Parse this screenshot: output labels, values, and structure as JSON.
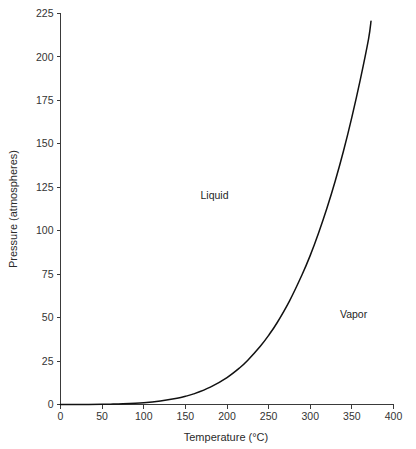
{
  "chart_data": {
    "type": "line",
    "title": "",
    "subtitle": "",
    "xlabel": "Temperature (°C)",
    "ylabel": "Pressure (atmospheres)",
    "xlim": [
      0,
      400
    ],
    "ylim": [
      0,
      225
    ],
    "xticks": [
      0,
      50,
      100,
      150,
      200,
      250,
      300,
      350,
      400
    ],
    "xtick_labels": [
      "0",
      "50",
      "100",
      "150",
      "200",
      "250",
      "300",
      "350",
      "400"
    ],
    "yticks": [
      0,
      25,
      50,
      75,
      100,
      125,
      150,
      175,
      200,
      225
    ],
    "ytick_labels": [
      "0",
      "25",
      "50",
      "75",
      "100",
      "125",
      "150",
      "175",
      "200",
      "225"
    ],
    "grid": false,
    "legend": false,
    "legend_position": "none",
    "line_color": "#111111",
    "series": [
      {
        "name": "Liquid-vapor boundary",
        "x": [
          0,
          25,
          50,
          60,
          75,
          100,
          120,
          140,
          150,
          160,
          180,
          200,
          215,
          225,
          240,
          250,
          260,
          275,
          290,
          300,
          310,
          320,
          330,
          340,
          350,
          360,
          370,
          373
        ],
        "values": [
          0.006,
          0.03,
          0.12,
          0.2,
          0.38,
          1.0,
          2.0,
          3.6,
          4.7,
          6.1,
          10.0,
          15.5,
          21.0,
          25.5,
          33.5,
          39.8,
          46.9,
          59.5,
          74.5,
          85.8,
          98.7,
          112.9,
          128.6,
          146.0,
          165.4,
          186.7,
          210.3,
          220.6
        ]
      }
    ],
    "annotations": [
      {
        "text": "Liquid",
        "x": 185,
        "y": 118
      },
      {
        "text": "Vapor",
        "x": 352,
        "y": 50
      }
    ]
  }
}
